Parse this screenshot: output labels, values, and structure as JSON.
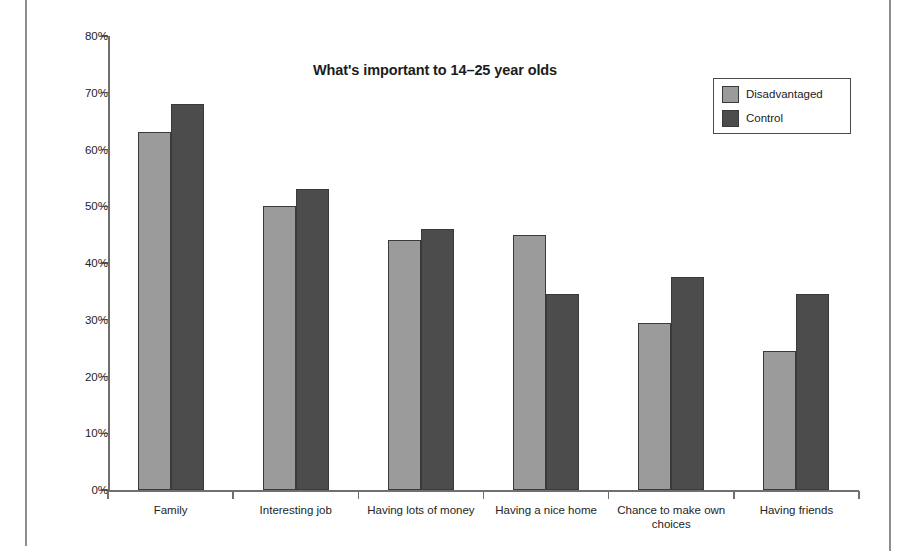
{
  "chart_data": {
    "type": "bar",
    "title": "What's important to 14–25 year olds",
    "xlabel": "",
    "ylabel": "",
    "ylim": [
      0,
      80
    ],
    "ytick_labels": [
      "0%",
      "10%",
      "20%",
      "30%",
      "40%",
      "50%",
      "60%",
      "70%",
      "80%"
    ],
    "ytick_values": [
      0,
      10,
      20,
      30,
      40,
      50,
      60,
      70,
      80
    ],
    "grid": false,
    "legend_position": "top-right",
    "value_unit": "percent",
    "categories": [
      "Family",
      "Interesting job",
      "Having lots of money",
      "Having a nice home",
      "Chance to make own choices",
      "Having friends"
    ],
    "series": [
      {
        "name": "Disadvantaged",
        "color": "#9b9b9b",
        "values": [
          63,
          50,
          44,
          45,
          29.5,
          24.5
        ]
      },
      {
        "name": "Control",
        "color": "#4c4c4c",
        "values": [
          68,
          53,
          46,
          34.5,
          37.5,
          34.5
        ]
      }
    ]
  },
  "legend": {
    "items": [
      {
        "label": "Disadvantaged"
      },
      {
        "label": "Control"
      }
    ]
  }
}
